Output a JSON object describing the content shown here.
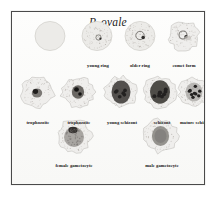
{
  "figure": {
    "title": "P. ovale",
    "frame_color": "#4a4a4a",
    "background_color": "#fbfbfa",
    "text_color": "#171717",
    "type": "microscopy-plate"
  },
  "rows": [
    {
      "id": "row-1",
      "cells": [
        {
          "label": "",
          "name": "normal-erythrocyte",
          "x": 38,
          "y": 24,
          "r": 15,
          "style": "plain",
          "fimbriated": false
        },
        {
          "label": "young ring",
          "name": "young-ring",
          "x": 85,
          "y": 24,
          "r": 15,
          "style": "ring-small",
          "fimbriated": false
        },
        {
          "label": "older ring",
          "name": "older-ring",
          "x": 128,
          "y": 24,
          "r": 15,
          "style": "ring-large",
          "fimbriated": false
        },
        {
          "label": "comet form",
          "name": "comet-form",
          "x": 172,
          "y": 24,
          "r": 15,
          "style": "comet",
          "fimbriated": true
        }
      ]
    },
    {
      "id": "row-2",
      "cells": [
        {
          "label": "trophozoite",
          "name": "trophozoite-1",
          "x": 26,
          "y": 80,
          "r": 16,
          "style": "troph-early",
          "fimbriated": true
        },
        {
          "label": "trophozoite",
          "name": "trophozoite-2",
          "x": 66,
          "y": 80,
          "r": 16,
          "style": "troph-late",
          "fimbriated": true
        },
        {
          "label": "young schizont",
          "name": "young-schizont",
          "x": 109,
          "y": 80,
          "r": 16,
          "style": "schizont-young",
          "fimbriated": true
        },
        {
          "label": "schizont",
          "name": "schizont",
          "x": 148,
          "y": 80,
          "r": 16,
          "style": "schizont",
          "fimbriated": true
        },
        {
          "label": "mature schizont",
          "name": "mature-schizont",
          "x": 182,
          "y": 80,
          "r": 15,
          "style": "schizont-mature",
          "fimbriated": true
        }
      ]
    },
    {
      "id": "row-3",
      "cells": [
        {
          "label": "female gametocyte",
          "name": "female-gametocyte",
          "x": 62,
          "y": 124,
          "r": 17,
          "style": "gametocyte-female",
          "fimbriated": true
        },
        {
          "label": "male gametocyte",
          "name": "male-gametocyte",
          "x": 148,
          "y": 124,
          "r": 17,
          "style": "gametocyte-male",
          "fimbriated": true
        }
      ]
    }
  ],
  "captions": {
    "row1": [
      {
        "text": "young ring",
        "x": 86
      },
      {
        "text": "older ring",
        "x": 128
      },
      {
        "text": "comet form",
        "x": 172
      }
    ],
    "row2": [
      {
        "text": "trophozoite",
        "x": 26
      },
      {
        "text": "trophozoite",
        "x": 67
      },
      {
        "text": "young schizont",
        "x": 110
      },
      {
        "text": "schizont",
        "x": 150
      },
      {
        "text": "mature schizont",
        "x": 184
      }
    ],
    "row3": [
      {
        "text": "female gametocyte",
        "x": 62
      },
      {
        "text": "male gametocyte",
        "x": 150
      }
    ]
  }
}
